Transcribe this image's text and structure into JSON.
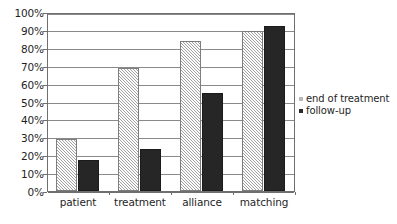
{
  "chart_data": {
    "type": "bar",
    "title": "",
    "subtitle": "",
    "xlabel": "",
    "ylabel": "",
    "categories": [
      "patient",
      "treatment",
      "alliance",
      "matching"
    ],
    "series": [
      {
        "name": "end of treatment",
        "color": "#d2d2d2",
        "pattern": "diagonal-hatch",
        "values": [
          29,
          68.5,
          84,
          89.5
        ]
      },
      {
        "name": "follow-up",
        "color": "#262626",
        "pattern": "solid",
        "values": [
          17.5,
          23.5,
          54.5,
          92
        ]
      }
    ],
    "ylim": [
      0,
      100
    ],
    "y_tick_values": [
      0,
      10,
      20,
      30,
      40,
      50,
      60,
      70,
      80,
      90,
      100
    ],
    "y_tick_labels": [
      "0%",
      "10%",
      "20%",
      "30%",
      "40%",
      "50%",
      "60%",
      "70%",
      "80%",
      "90%",
      "100%"
    ],
    "grid": true,
    "grid_axis": "y",
    "legend_position": "right",
    "legend_entries": [
      "end of treatment",
      "follow-up"
    ]
  }
}
